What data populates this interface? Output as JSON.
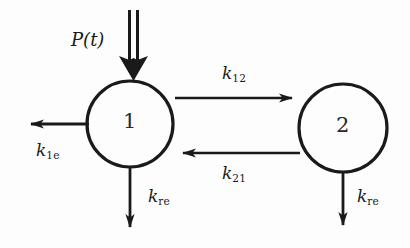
{
  "diagram": {
    "background_color": "#fdfdfd",
    "stroke_color": "#1a1a1a",
    "nodes": [
      {
        "id": "compartment-1",
        "label": "1",
        "cx": 130,
        "cy": 124,
        "r": 43
      },
      {
        "id": "compartment-2",
        "label": "2",
        "cx": 343,
        "cy": 128,
        "r": 44
      }
    ],
    "labels": {
      "input": {
        "text": "P(t)",
        "base": "P(t)",
        "sub": ""
      },
      "forward_rate": {
        "base": "k",
        "sub": "12",
        "text": "k12"
      },
      "backward_rate": {
        "base": "k",
        "sub": "21",
        "text": "k21"
      },
      "elimination_rate": {
        "base": "k",
        "sub": "1e",
        "text": "k1e"
      },
      "removal_rate_left": {
        "base": "k",
        "sub": "re",
        "text": "kre"
      },
      "removal_rate_right": {
        "base": "k",
        "sub": "re",
        "text": "kre"
      }
    },
    "arrows": [
      {
        "name": "input-arrow",
        "style": "double-shaft",
        "direction": "down",
        "from": [
          133,
          10
        ],
        "to": [
          133,
          80
        ]
      },
      {
        "name": "forward-arrow",
        "style": "single",
        "direction": "right",
        "from": [
          175,
          98
        ],
        "to": [
          297,
          98
        ]
      },
      {
        "name": "backward-arrow",
        "style": "single",
        "direction": "left",
        "from": [
          300,
          153
        ],
        "to": [
          178,
          153
        ]
      },
      {
        "name": "elimination-arrow",
        "style": "single",
        "direction": "left",
        "from": [
          89,
          124
        ],
        "to": [
          26,
          124
        ]
      },
      {
        "name": "removal-arrow-left",
        "style": "single",
        "direction": "down",
        "from": [
          130,
          167
        ],
        "to": [
          130,
          232
        ]
      },
      {
        "name": "removal-arrow-right",
        "style": "single",
        "direction": "down",
        "from": [
          343,
          172
        ],
        "to": [
          343,
          230
        ]
      }
    ]
  }
}
